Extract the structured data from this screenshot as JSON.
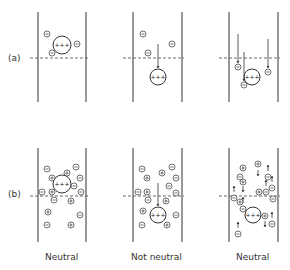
{
  "rows": [
    {
      "label": "(a)",
      "y_label": 60
    },
    {
      "label": "(b)",
      "y_label": 196
    }
  ],
  "columns": [
    {
      "caption": "Neutral"
    },
    {
      "caption": "Not neutral"
    },
    {
      "caption": "Neutral"
    }
  ],
  "panels": {
    "a1": {
      "walls": [
        38,
        86
      ],
      "top": 12,
      "bottom": 102,
      "plane_y": 58,
      "central": {
        "x": 62,
        "y": 45,
        "r": 9,
        "charge": "+++"
      },
      "ions": [
        {
          "x": 47,
          "y": 34,
          "s": "-"
        },
        {
          "x": 77,
          "y": 44,
          "s": "-"
        },
        {
          "x": 52,
          "y": 53,
          "s": "-"
        }
      ],
      "arrows": []
    },
    "a2": {
      "walls": [
        133,
        182
      ],
      "top": 12,
      "bottom": 102,
      "plane_y": 58,
      "central": {
        "x": 158,
        "y": 77,
        "r": 8,
        "charge": "+++"
      },
      "ions": [
        {
          "x": 143,
          "y": 34,
          "s": "-"
        },
        {
          "x": 172,
          "y": 44,
          "s": "-"
        },
        {
          "x": 148,
          "y": 53,
          "s": "-"
        }
      ],
      "arrows": [
        {
          "x1": 158,
          "y1": 44,
          "x2": 158,
          "y2": 68
        }
      ]
    },
    "a3": {
      "walls": [
        229,
        278
      ],
      "top": 12,
      "bottom": 102,
      "plane_y": 58,
      "central": {
        "x": 252,
        "y": 77,
        "r": 8,
        "charge": "+++"
      },
      "ions": [
        {
          "x": 238,
          "y": 67,
          "s": "-"
        },
        {
          "x": 244,
          "y": 85,
          "s": "-"
        },
        {
          "x": 268,
          "y": 72,
          "s": "-"
        }
      ],
      "arrows": [
        {
          "x1": 238,
          "y1": 34,
          "x2": 238,
          "y2": 63
        },
        {
          "x1": 244,
          "y1": 52,
          "x2": 244,
          "y2": 81
        },
        {
          "x1": 268,
          "y1": 39,
          "x2": 268,
          "y2": 68
        }
      ]
    },
    "b1": {
      "walls": [
        38,
        86
      ],
      "top": 148,
      "bottom": 242,
      "plane_y": 196,
      "central": {
        "x": 62,
        "y": 184,
        "r": 9,
        "charge": "+++"
      },
      "ions": [
        {
          "x": 47,
          "y": 169,
          "s": "-"
        },
        {
          "x": 76,
          "y": 167,
          "s": "-"
        },
        {
          "x": 52,
          "y": 178,
          "s": "+"
        },
        {
          "x": 67,
          "y": 173,
          "s": "+"
        },
        {
          "x": 80,
          "y": 178,
          "s": "-"
        },
        {
          "x": 74,
          "y": 186,
          "s": "-"
        },
        {
          "x": 42,
          "y": 192,
          "s": "-"
        },
        {
          "x": 52,
          "y": 192,
          "s": "+"
        },
        {
          "x": 81,
          "y": 192,
          "s": "-"
        },
        {
          "x": 54,
          "y": 200,
          "s": "-"
        },
        {
          "x": 71,
          "y": 201,
          "s": "+"
        },
        {
          "x": 48,
          "y": 212,
          "s": "+"
        },
        {
          "x": 80,
          "y": 215,
          "s": "-"
        },
        {
          "x": 47,
          "y": 225,
          "s": "-"
        },
        {
          "x": 71,
          "y": 225,
          "s": "+"
        }
      ],
      "arrows": []
    },
    "b2": {
      "walls": [
        133,
        182
      ],
      "top": 148,
      "bottom": 242,
      "plane_y": 196,
      "central": {
        "x": 158,
        "y": 215,
        "r": 8,
        "charge": "+++"
      },
      "ions": [
        {
          "x": 142,
          "y": 169,
          "s": "-"
        },
        {
          "x": 172,
          "y": 167,
          "s": "-"
        },
        {
          "x": 147,
          "y": 178,
          "s": "+"
        },
        {
          "x": 162,
          "y": 173,
          "s": "+"
        },
        {
          "x": 176,
          "y": 178,
          "s": "-"
        },
        {
          "x": 169,
          "y": 186,
          "s": "-"
        },
        {
          "x": 138,
          "y": 192,
          "s": "-"
        },
        {
          "x": 147,
          "y": 192,
          "s": "+"
        },
        {
          "x": 176,
          "y": 193,
          "s": "-"
        },
        {
          "x": 148,
          "y": 200,
          "s": "-"
        },
        {
          "x": 166,
          "y": 201,
          "s": "+"
        },
        {
          "x": 143,
          "y": 211,
          "s": "+"
        },
        {
          "x": 176,
          "y": 215,
          "s": "-"
        },
        {
          "x": 142,
          "y": 225,
          "s": "-"
        },
        {
          "x": 167,
          "y": 225,
          "s": "+"
        }
      ],
      "arrows": [
        {
          "x1": 158,
          "y1": 183,
          "x2": 158,
          "y2": 206
        }
      ]
    },
    "b3": {
      "walls": [
        229,
        278
      ],
      "top": 148,
      "bottom": 242,
      "plane_y": 196,
      "central": {
        "x": 253,
        "y": 215,
        "r": 8,
        "charge": "+++"
      },
      "ions": [
        {
          "x": 243,
          "y": 168,
          "s": "+"
        },
        {
          "x": 258,
          "y": 164,
          "s": "+"
        },
        {
          "x": 240,
          "y": 177,
          "s": "-"
        },
        {
          "x": 268,
          "y": 177,
          "s": "-"
        },
        {
          "x": 243,
          "y": 182,
          "s": "+"
        },
        {
          "x": 272,
          "y": 188,
          "s": "-"
        },
        {
          "x": 259,
          "y": 192,
          "s": "+"
        },
        {
          "x": 266,
          "y": 192,
          "s": "-"
        },
        {
          "x": 234,
          "y": 198,
          "s": "-"
        },
        {
          "x": 240,
          "y": 202,
          "s": "+"
        },
        {
          "x": 243,
          "y": 209,
          "s": "-"
        },
        {
          "x": 273,
          "y": 199,
          "s": "-"
        },
        {
          "x": 265,
          "y": 216,
          "s": "+"
        },
        {
          "x": 272,
          "y": 224,
          "s": "-"
        },
        {
          "x": 238,
          "y": 234,
          "s": "-"
        }
      ],
      "arrows": [
        {
          "x1": 258,
          "y1": 170,
          "x2": 258,
          "y2": 176
        },
        {
          "x1": 268,
          "y1": 171,
          "x2": 268,
          "y2": 165
        },
        {
          "x1": 243,
          "y1": 186,
          "x2": 243,
          "y2": 192
        },
        {
          "x1": 266,
          "y1": 186,
          "x2": 266,
          "y2": 180
        },
        {
          "x1": 234,
          "y1": 192,
          "x2": 234,
          "y2": 186
        },
        {
          "x1": 272,
          "y1": 182,
          "x2": 272,
          "y2": 176
        },
        {
          "x1": 243,
          "y1": 203,
          "x2": 243,
          "y2": 197
        },
        {
          "x1": 265,
          "y1": 221,
          "x2": 265,
          "y2": 227
        },
        {
          "x1": 272,
          "y1": 218,
          "x2": 272,
          "y2": 212
        },
        {
          "x1": 238,
          "y1": 228,
          "x2": 238,
          "y2": 222
        }
      ]
    }
  }
}
